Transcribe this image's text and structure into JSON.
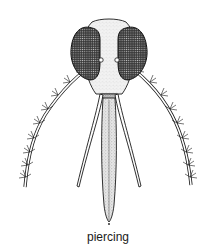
{
  "figure": {
    "caption": "piercing",
    "colors": {
      "ink": "#1a1a1a",
      "background": "#ffffff",
      "stipple": "#9a9a9a"
    }
  }
}
